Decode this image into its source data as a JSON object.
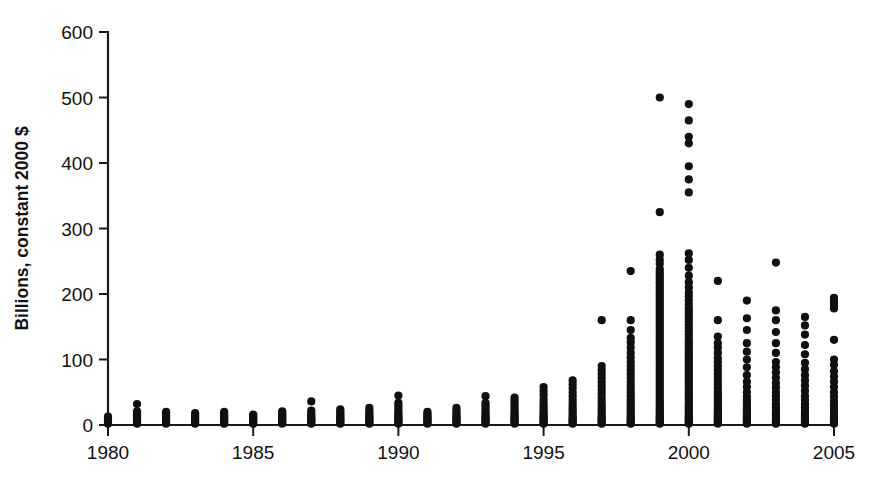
{
  "chart_data": {
    "type": "scatter",
    "title": "",
    "subtitle": "",
    "xlabel": "",
    "ylabel": "Billions, constant 2000 $",
    "xlim": [
      1980,
      2005
    ],
    "ylim": [
      0,
      600
    ],
    "xticks": [
      1980,
      1985,
      1990,
      1995,
      2000,
      2005
    ],
    "xtick_labels": [
      "1980",
      "1985",
      "1990",
      "1995",
      "2000",
      "2005"
    ],
    "xticks_minor": [
      1981,
      1982,
      1983,
      1984,
      1986,
      1987,
      1988,
      1989,
      1991,
      1992,
      1993,
      1994,
      1996,
      1997,
      1998,
      1999,
      2001,
      2002,
      2003,
      2004
    ],
    "yticks": [
      0,
      100,
      200,
      300,
      400,
      500,
      600
    ],
    "ytick_labels": [
      "0",
      "100",
      "200",
      "300",
      "400",
      "500",
      "600"
    ],
    "grid": false,
    "legend": false,
    "legend_position": "none",
    "marker": "filled-circle",
    "marker_color": "#101010",
    "marker_size_px": 5,
    "point_count_note": "Dense vertical columns at integer years; values in billions of constant 2000 dollars",
    "series": [
      {
        "name": "Deal value",
        "points": [
          {
            "x": 1980,
            "values": [
              2,
              4,
              6,
              8,
              10,
              13
            ]
          },
          {
            "x": 1981,
            "values": [
              2,
              4,
              6,
              8,
              10,
              12,
              15,
              18,
              21,
              32
            ]
          },
          {
            "x": 1982,
            "values": [
              2,
              4,
              6,
              8,
              10,
              12,
              15,
              18,
              20
            ]
          },
          {
            "x": 1983,
            "values": [
              2,
              4,
              6,
              8,
              10,
              12,
              14,
              16,
              18
            ]
          },
          {
            "x": 1984,
            "values": [
              2,
              4,
              6,
              8,
              10,
              12,
              14,
              17,
              20
            ]
          },
          {
            "x": 1985,
            "values": [
              2,
              4,
              6,
              8,
              10,
              12,
              14,
              16
            ]
          },
          {
            "x": 1986,
            "values": [
              2,
              4,
              6,
              8,
              10,
              12,
              15,
              18,
              21
            ]
          },
          {
            "x": 1987,
            "values": [
              2,
              4,
              6,
              8,
              10,
              12,
              15,
              18,
              22,
              36
            ]
          },
          {
            "x": 1988,
            "values": [
              2,
              4,
              6,
              8,
              10,
              12,
              15,
              18,
              21,
              24
            ]
          },
          {
            "x": 1989,
            "values": [
              2,
              4,
              6,
              8,
              10,
              12,
              15,
              18,
              22,
              26
            ]
          },
          {
            "x": 1990,
            "values": [
              2,
              4,
              6,
              8,
              10,
              12,
              15,
              18,
              22,
              26,
              30,
              34,
              45
            ]
          },
          {
            "x": 1991,
            "values": [
              2,
              4,
              6,
              8,
              10,
              12,
              14,
              17,
              20
            ]
          },
          {
            "x": 1992,
            "values": [
              2,
              4,
              6,
              8,
              10,
              12,
              15,
              18,
              22,
              26
            ]
          },
          {
            "x": 1993,
            "values": [
              2,
              4,
              6,
              8,
              10,
              12,
              15,
              18,
              22,
              26,
              30,
              34,
              44
            ]
          },
          {
            "x": 1994,
            "values": [
              2,
              4,
              6,
              8,
              10,
              12,
              15,
              18,
              22,
              26,
              30,
              34,
              38,
              42
            ]
          },
          {
            "x": 1995,
            "values": [
              2,
              4,
              6,
              8,
              10,
              12,
              15,
              18,
              22,
              26,
              30,
              35,
              40,
              46,
              52,
              58
            ]
          },
          {
            "x": 1996,
            "values": [
              2,
              4,
              6,
              8,
              10,
              13,
              16,
              20,
              24,
              28,
              33,
              38,
              44,
              50,
              56,
              62,
              68
            ]
          },
          {
            "x": 1997,
            "values": [
              2,
              4,
              6,
              8,
              10,
              13,
              16,
              20,
              24,
              28,
              32,
              37,
              42,
              48,
              54,
              60,
              66,
              72,
              78,
              84,
              90,
              160
            ]
          },
          {
            "x": 1998,
            "values": [
              2,
              4,
              6,
              8,
              10,
              13,
              16,
              20,
              24,
              28,
              32,
              36,
              40,
              45,
              50,
              55,
              60,
              66,
              72,
              78,
              84,
              90,
              96,
              103,
              110,
              118,
              126,
              133,
              145,
              160,
              235
            ]
          },
          {
            "x": 1999,
            "values": [
              2,
              4,
              6,
              8,
              10,
              12,
              14,
              17,
              20,
              23,
              26,
              29,
              32,
              35,
              38,
              42,
              46,
              50,
              54,
              58,
              62,
              66,
              70,
              74,
              78,
              82,
              86,
              90,
              94,
              98,
              102,
              106,
              110,
              114,
              118,
              122,
              126,
              130,
              134,
              138,
              142,
              146,
              150,
              154,
              158,
              162,
              166,
              170,
              174,
              178,
              182,
              186,
              190,
              194,
              198,
              202,
              206,
              210,
              214,
              218,
              222,
              226,
              230,
              234,
              238,
              246,
              252,
              260,
              325,
              500
            ]
          },
          {
            "x": 2000,
            "values": [
              2,
              4,
              6,
              8,
              10,
              12,
              14,
              17,
              20,
              23,
              26,
              29,
              32,
              36,
              40,
              44,
              48,
              52,
              56,
              60,
              64,
              68,
              72,
              76,
              80,
              84,
              88,
              92,
              96,
              100,
              104,
              108,
              112,
              116,
              120,
              124,
              128,
              133,
              138,
              143,
              148,
              153,
              158,
              163,
              168,
              173,
              178,
              184,
              190,
              196,
              202,
              210,
              218,
              228,
              240,
              252,
              262,
              355,
              375,
              395,
              430,
              440,
              465,
              490
            ]
          },
          {
            "x": 2001,
            "values": [
              2,
              4,
              6,
              8,
              10,
              12,
              15,
              18,
              21,
              24,
              28,
              32,
              36,
              40,
              44,
              48,
              52,
              57,
              62,
              67,
              72,
              78,
              84,
              90,
              96,
              102,
              110,
              118,
              125,
              135,
              160,
              220
            ]
          },
          {
            "x": 2002,
            "values": [
              2,
              4,
              6,
              8,
              10,
              13,
              16,
              20,
              24,
              28,
              33,
              38,
              43,
              50,
              58,
              66,
              76,
              88,
              100,
              112,
              125,
              145,
              163,
              190
            ]
          },
          {
            "x": 2003,
            "values": [
              2,
              4,
              6,
              8,
              11,
              14,
              18,
              22,
              27,
              32,
              38,
              44,
              50,
              57,
              64,
              72,
              80,
              88,
              96,
              110,
              125,
              142,
              160,
              175,
              248
            ]
          },
          {
            "x": 2004,
            "values": [
              2,
              4,
              6,
              8,
              11,
              14,
              18,
              22,
              27,
              32,
              38,
              44,
              52,
              60,
              68,
              76,
              85,
              95,
              108,
              122,
              138,
              152,
              165
            ]
          },
          {
            "x": 2005,
            "values": [
              2,
              4,
              6,
              9,
              12,
              16,
              20,
              25,
              30,
              36,
              43,
              50,
              58,
              66,
              74,
              82,
              92,
              100,
              130,
              178,
              182,
              186,
              190,
              194
            ]
          }
        ]
      }
    ]
  }
}
